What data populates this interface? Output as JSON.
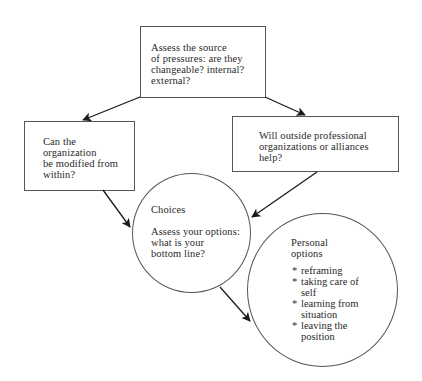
{
  "diagram": {
    "top_box": {
      "text": "Assess the source\nof pressures: are they\nchangeable? internal?\nexternal?"
    },
    "left_box": {
      "text": "Can the\norganization\nbe modified from\nwithin?"
    },
    "right_box": {
      "text": "Will outside professional\norganizations or alliances\nhelp?"
    },
    "choices_circle": {
      "title": "Choices",
      "text": "Assess your options:\nwhat is your\nbottom line?"
    },
    "personal_circle": {
      "title": "Personal\noptions",
      "items": [
        "reframing",
        "taking care of\nself",
        "learning from\nsituation",
        "leaving the\nposition"
      ]
    },
    "colors": {
      "line": "#555555",
      "arrow": "#1a1a1a",
      "text": "#2a2a2a",
      "background": "#ffffff"
    }
  }
}
